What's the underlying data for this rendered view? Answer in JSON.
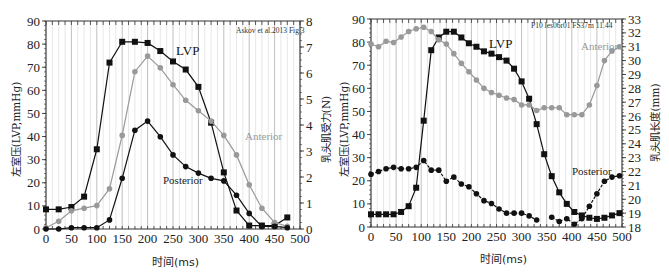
{
  "chart_data": [
    {
      "type": "line",
      "annotation": "Askov et al.2013 Fig 3",
      "xlabel": "时间(ms)",
      "ylabel": "左室压(LVP,mmHg)",
      "y2label": "乳头肌受力(N)",
      "xlim": [
        0,
        500
      ],
      "ylim": [
        0,
        90
      ],
      "y2lim": [
        0,
        8
      ],
      "xticks": [
        0,
        50,
        100,
        150,
        200,
        250,
        300,
        350,
        400,
        450,
        500
      ],
      "yticks": [
        0,
        10,
        20,
        30,
        40,
        50,
        60,
        70,
        80,
        90
      ],
      "y2ticks": [
        0,
        1,
        2,
        3,
        4,
        5,
        6,
        7,
        8
      ],
      "grid": "vertical",
      "series": [
        {
          "name": "LVP",
          "axis": "left",
          "marker": "square",
          "color": "#111111",
          "x": [
            0,
            25,
            50,
            75,
            100,
            125,
            150,
            175,
            200,
            225,
            250,
            275,
            300,
            325,
            350,
            375,
            400,
            425,
            450,
            475,
            500
          ],
          "values": [
            8.5,
            8.5,
            9.5,
            14,
            34.5,
            72,
            81,
            81,
            80.5,
            77,
            72.5,
            69,
            61.5,
            46,
            24.5,
            8,
            1.5,
            1.5,
            1.5,
            5,
            null
          ]
        },
        {
          "name": "Anterior",
          "axis": "right",
          "marker": "circle",
          "color": "#999999",
          "x": [
            0,
            25,
            50,
            75,
            100,
            125,
            150,
            175,
            200,
            225,
            250,
            275,
            300,
            325,
            350,
            375,
            400,
            425,
            450,
            475
          ],
          "values": [
            0.05,
            0.3,
            0.7,
            0.8,
            0.9,
            1.55,
            3.6,
            6.05,
            6.65,
            6.2,
            5.55,
            4.95,
            4.55,
            4.15,
            3.6,
            2.85,
            1.7,
            0.8,
            0.25,
            0.1
          ]
        },
        {
          "name": "Posterior",
          "axis": "right",
          "marker": "circle",
          "color": "#111111",
          "x": [
            0,
            25,
            50,
            75,
            100,
            125,
            150,
            175,
            200,
            225,
            250,
            275,
            300,
            325,
            350,
            375,
            400,
            425,
            450,
            475
          ],
          "values": [
            0.0,
            0.0,
            0.05,
            0.05,
            0.05,
            0.35,
            1.95,
            3.8,
            4.15,
            3.55,
            2.85,
            2.4,
            2.15,
            1.95,
            1.85,
            1.3,
            0.6,
            0.1,
            0.1,
            0.05
          ]
        }
      ]
    },
    {
      "type": "line",
      "annotation": "P10 les06r01 FS37m 11.44",
      "xlabel": "时间(ms)",
      "ylabel": "左室压(LVP,mmHg)",
      "y2label": "乳头肌长度(mm)",
      "xlim": [
        0,
        500
      ],
      "ylim": [
        0,
        90
      ],
      "y2lim": [
        18,
        33
      ],
      "xticks": [
        0,
        50,
        100,
        150,
        200,
        250,
        300,
        350,
        400,
        450,
        500
      ],
      "yticks": [
        0,
        10,
        20,
        30,
        40,
        50,
        60,
        70,
        80,
        90
      ],
      "y2ticks": [
        18,
        19,
        20,
        21,
        22,
        23,
        24,
        25,
        26,
        27,
        28,
        29,
        30,
        31,
        32,
        33
      ],
      "grid": "vertical",
      "series": [
        {
          "name": "LVP",
          "axis": "left",
          "marker": "square",
          "color": "#111111",
          "x": [
            0,
            15,
            30,
            45,
            60,
            75,
            90,
            105,
            120,
            135,
            150,
            165,
            180,
            195,
            210,
            225,
            240,
            255,
            270,
            285,
            300,
            315,
            330,
            345,
            360,
            375,
            390,
            405,
            420,
            435,
            450,
            465,
            480,
            495
          ],
          "values": [
            5.5,
            5.5,
            5.5,
            5.5,
            6.5,
            9,
            17,
            46,
            76.5,
            82,
            84.5,
            84.5,
            82,
            79.5,
            78,
            76,
            75,
            73.5,
            72,
            68.5,
            63,
            55.5,
            44.5,
            31.5,
            22,
            15,
            10,
            6.5,
            5,
            4,
            3.5,
            4,
            5,
            6
          ]
        },
        {
          "name": "Anterior",
          "axis": "right",
          "marker": "circle",
          "color": "#999999",
          "x": [
            0,
            15,
            30,
            45,
            60,
            75,
            90,
            105,
            120,
            135,
            150,
            165,
            180,
            195,
            210,
            225,
            240,
            255,
            270,
            285,
            300,
            315,
            330,
            345,
            360,
            375,
            390,
            405,
            420,
            435,
            450,
            465,
            480,
            495
          ],
          "values": [
            31.2,
            31.0,
            31.4,
            31.3,
            31.7,
            32.1,
            32.3,
            32.4,
            32.1,
            31.5,
            31.2,
            30.5,
            29.8,
            29.2,
            28.6,
            28.0,
            27.7,
            27.5,
            27.3,
            27.2,
            26.8,
            26.8,
            26.4,
            26.6,
            26.6,
            26.6,
            26.1,
            26.1,
            26.1,
            26.8,
            28.2,
            30.0,
            30.7,
            31.0
          ]
        },
        {
          "name": "Posterior",
          "axis": "right",
          "marker": "circle",
          "color": "#111111",
          "x": [
            0,
            15,
            30,
            45,
            60,
            75,
            90,
            105,
            120,
            135,
            150,
            165,
            180,
            195,
            210,
            225,
            240,
            255,
            270,
            285,
            300,
            315,
            330,
            360,
            375,
            390,
            405,
            420,
            435,
            450,
            465,
            480,
            495
          ],
          "values": [
            21.8,
            22.0,
            22.2,
            22.3,
            22.2,
            22.2,
            22.3,
            22.8,
            22.1,
            22.1,
            21.3,
            21.6,
            21.1,
            20.9,
            20.4,
            19.9,
            19.7,
            19.3,
            19.0,
            19.0,
            19.0,
            18.8,
            18.5,
            18.7,
            18.4,
            18.6,
            18.2,
            18.6,
            19.5,
            20.4,
            21.3,
            21.6,
            21.7
          ]
        }
      ]
    }
  ],
  "labels": {
    "left": {
      "annotation": "Askov et al.2013 Fig 3",
      "lvp": "LVP",
      "anterior": "Anterior",
      "posterior": "Posterior",
      "xlabel": "时间(ms)",
      "ylabel": "左室压(LVP,mmHg)",
      "y2label": "乳头肌受力(N)"
    },
    "right": {
      "annotation": "P10 les06r01 FS37m 11.44",
      "lvp": "LVP",
      "anterior": "Anterior",
      "posterior": "Posterior",
      "xlabel": "时间(ms)",
      "ylabel": "左室压(LVP,mmHg)",
      "y2label": "乳头肌长度(mm)"
    }
  },
  "colors": {
    "black": "#111111",
    "gray": "#999999",
    "grid": "#c8c8c8"
  }
}
